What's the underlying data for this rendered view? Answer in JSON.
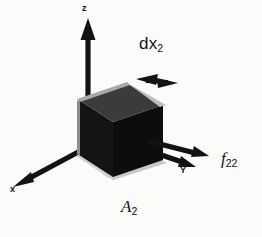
{
  "figure": {
    "background_color": "#fbfbfa",
    "ink_color": "#121212"
  },
  "axes": [
    {
      "id": "z",
      "label": "z",
      "direction": "up",
      "arrow_from": [
        88,
        100
      ],
      "arrow_to": [
        88,
        22
      ],
      "label_pos": [
        84,
        6
      ]
    },
    {
      "id": "x",
      "label": "x",
      "direction": "down-left",
      "arrow_from": [
        66,
        152
      ],
      "arrow_to": [
        15,
        186
      ],
      "label_pos": [
        12,
        188
      ]
    },
    {
      "id": "Y",
      "label": "Y",
      "direction": "right-down",
      "arrow_from": [
        140,
        148
      ],
      "arrow_to": [
        196,
        167
      ],
      "label_pos": [
        182,
        169
      ]
    }
  ],
  "annotations": [
    {
      "id": "dx2",
      "text": "dx",
      "subscript": "2",
      "kind": "dimension",
      "arrow_style": "double-headed",
      "label_pos": [
        140,
        38
      ],
      "arrow_from": [
        138,
        81
      ],
      "arrow_to": [
        176,
        81
      ]
    },
    {
      "id": "f22",
      "text": "f",
      "subscript": "22",
      "kind": "force",
      "arrow_style": "single-headed",
      "label_pos": [
        222,
        152
      ],
      "arrow_from": [
        148,
        141
      ],
      "arrow_to": [
        209,
        156
      ]
    },
    {
      "id": "A2",
      "text": "A",
      "subscript": "2",
      "kind": "area-label",
      "label_pos": [
        122,
        200
      ]
    }
  ],
  "solid": {
    "shape": "cuboid",
    "face_colors": {
      "top": "#3b3b3b",
      "front": "#141414",
      "right": "#0d0d0d",
      "edge_highlight": "#bdbdbd",
      "base_strip": "#c9c9c9"
    },
    "vertices": {
      "top_back_left": [
        79,
        100
      ],
      "top_back_right": [
        128,
        84
      ],
      "top_front_right": [
        163,
        105
      ],
      "top_front_left": [
        113,
        122
      ],
      "bottom_front_left": [
        113,
        177
      ],
      "bottom_front_right": [
        163,
        160
      ],
      "bottom_left": [
        79,
        155
      ]
    }
  }
}
